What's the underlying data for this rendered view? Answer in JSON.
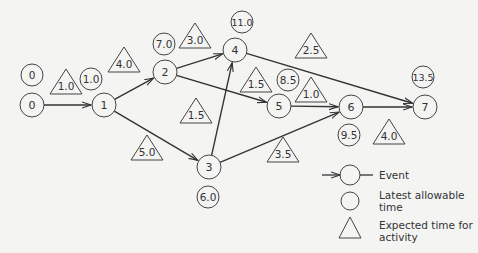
{
  "diagram": {
    "type": "PERT network",
    "events": [
      {
        "id": "0",
        "label": "0",
        "x": 32,
        "y": 105,
        "latest": "0",
        "latest_x": 32,
        "latest_y": 75
      },
      {
        "id": "1",
        "label": "1",
        "x": 104,
        "y": 105,
        "latest": "1.0",
        "latest_x": 91,
        "latest_y": 79
      },
      {
        "id": "2",
        "label": "2",
        "x": 165,
        "y": 72,
        "latest": "7.0",
        "latest_x": 164,
        "latest_y": 44
      },
      {
        "id": "3",
        "label": "3",
        "x": 209,
        "y": 167,
        "latest": "6.0",
        "latest_x": 208,
        "latest_y": 197
      },
      {
        "id": "4",
        "label": "4",
        "x": 235,
        "y": 50,
        "latest": "11.0",
        "latest_x": 242,
        "latest_y": 22
      },
      {
        "id": "5",
        "label": "5",
        "x": 279,
        "y": 106,
        "latest": "8.5",
        "latest_x": 288,
        "latest_y": 80
      },
      {
        "id": "6",
        "label": "6",
        "x": 351,
        "y": 107,
        "latest": "9.5",
        "latest_x": 349,
        "latest_y": 135
      },
      {
        "id": "7",
        "label": "7",
        "x": 425,
        "y": 107,
        "latest": "13.5",
        "latest_x": 423,
        "latest_y": 77
      }
    ],
    "activities": [
      {
        "from": "0",
        "to": "1",
        "expected": "1.0",
        "tx": 66,
        "ty": 86
      },
      {
        "from": "1",
        "to": "2",
        "expected": "4.0",
        "tx": 124,
        "ty": 64
      },
      {
        "from": "1",
        "to": "3",
        "expected": "5.0",
        "tx": 147,
        "ty": 152
      },
      {
        "from": "2",
        "to": "4",
        "expected": "3.0",
        "tx": 195,
        "ty": 40
      },
      {
        "from": "2",
        "to": "5",
        "expected": "1.5",
        "tx": 256,
        "ty": 84
      },
      {
        "from": "3",
        "to": "4",
        "expected": "1.5",
        "tx": 196,
        "ty": 115
      },
      {
        "from": "3",
        "to": "6",
        "expected": "3.5",
        "tx": 283,
        "ty": 154
      },
      {
        "from": "4",
        "to": "7",
        "expected": "2.5",
        "tx": 311,
        "ty": 50
      },
      {
        "from": "5",
        "to": "6",
        "expected": "1.0",
        "tx": 311,
        "ty": 94
      },
      {
        "from": "6",
        "to": "7",
        "expected": "4.0",
        "tx": 389,
        "ty": 136
      }
    ]
  },
  "legend": {
    "event": "Event",
    "latest_line1": "Latest allowable",
    "latest_line2": "time",
    "expected_line1": "Expected time for",
    "expected_line2": "activity"
  },
  "colors": {
    "line": "#333333",
    "background": "#f4f4f3"
  }
}
